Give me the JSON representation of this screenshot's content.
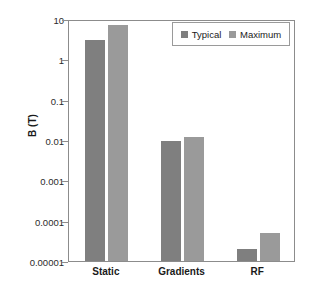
{
  "chart_data": {
    "type": "bar",
    "title": "",
    "subtitle": "",
    "xlabel": "",
    "ylabel": "B (T)",
    "yscale": "log",
    "ylim": [
      1e-05,
      10
    ],
    "grid": false,
    "legend_position": "top-right",
    "categories": [
      "Static",
      "Gradients",
      "RF"
    ],
    "ytick_labels": [
      "10",
      "1",
      "0.1",
      "0.01",
      "0.001",
      "0.0001",
      "0.00001"
    ],
    "ytick_values": [
      10,
      1,
      0.1,
      0.01,
      0.001,
      0.0001,
      1e-05
    ],
    "series": [
      {
        "name": "Typical",
        "color": "#7f7f7f",
        "values": [
          3,
          0.0095,
          2e-05
        ]
      },
      {
        "name": "Maximum",
        "color": "#9a9a9a",
        "values": [
          7,
          0.012,
          5e-05
        ]
      }
    ],
    "annotations": []
  },
  "legend": {
    "entries": [
      {
        "label": "Typical"
      },
      {
        "label": "Maximum"
      }
    ]
  },
  "colors": {
    "typical": "#7f7f7f",
    "maximum": "#9a9a9a",
    "frame": "#8c8c8c",
    "text": "#1a1a1a",
    "background": "#ffffff"
  }
}
